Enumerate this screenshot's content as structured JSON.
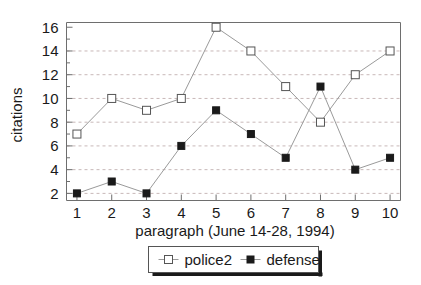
{
  "chart_data": {
    "type": "line",
    "title": "",
    "xlabel": "paragraph (June 14-28, 1994)",
    "ylabel": "citations",
    "x": [
      1,
      2,
      3,
      4,
      5,
      6,
      7,
      8,
      9,
      10
    ],
    "xticklabels": [
      "1",
      "2",
      "3",
      "4",
      "5",
      "6",
      "7",
      "8",
      "9",
      "10"
    ],
    "yticklabels": [
      "2",
      "4",
      "6",
      "8",
      "10",
      "12",
      "14",
      "16"
    ],
    "yticks": [
      2,
      4,
      6,
      8,
      10,
      12,
      14,
      16
    ],
    "ylim": [
      1.4,
      16.4
    ],
    "xlim": [
      0.7,
      10.3
    ],
    "grid": true,
    "grid_style": "dashed-horizontal",
    "legend_position": "bottom-center",
    "series": [
      {
        "name": "police2",
        "marker": "open-square",
        "marker_fill": "#ffffff",
        "marker_stroke": "#555555",
        "line_color": "#9a9a9a",
        "values": [
          7,
          10,
          9,
          10,
          16,
          14,
          11,
          8,
          12,
          14
        ]
      },
      {
        "name": "defense",
        "marker": "filled-square",
        "marker_fill": "#1a1a1a",
        "marker_stroke": "#1a1a1a",
        "line_color": "#9a9a9a",
        "values": [
          2,
          3,
          2,
          6,
          9,
          7,
          5,
          11,
          4,
          5
        ]
      }
    ],
    "colors": {
      "background": "#ffffff",
      "axis": "#6e6e6e",
      "grid": "#c8b8b8",
      "text": "#1a1a1a",
      "legend_border": "#555555",
      "legend_shadow": "#1a1a1a"
    }
  },
  "legend": {
    "entries": [
      {
        "label": "police2"
      },
      {
        "label": "defense"
      }
    ]
  }
}
